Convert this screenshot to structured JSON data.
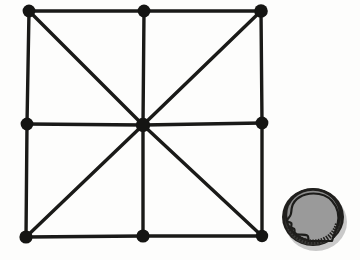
{
  "figure": {
    "background_color": "#fdfdfc",
    "ink_color": "#1a1a18",
    "canvas": {
      "width": 360,
      "height": 260
    }
  },
  "graph": {
    "style": {
      "edge_color": "#1a1a18",
      "edge_width": 3.4,
      "node_color": "#151513",
      "node_radius": 6.2,
      "center_node_radius": 7.0
    },
    "nodes": [
      {
        "id": "top-left",
        "label": "top-left corner node",
        "x": 29,
        "y": 11,
        "r": 6.4
      },
      {
        "id": "top-middle",
        "label": "top-middle node",
        "x": 144,
        "y": 11,
        "r": 6.4
      },
      {
        "id": "top-right",
        "label": "top-right corner node",
        "x": 261,
        "y": 11,
        "r": 6.8
      },
      {
        "id": "left-middle",
        "label": "left-middle node",
        "x": 27,
        "y": 124,
        "r": 6.4
      },
      {
        "id": "center",
        "label": "center hub node",
        "x": 143,
        "y": 125,
        "r": 7.2
      },
      {
        "id": "right-middle",
        "label": "right-middle node",
        "x": 262,
        "y": 123,
        "r": 6.4
      },
      {
        "id": "bottom-left",
        "label": "bottom-left corner node",
        "x": 26,
        "y": 237,
        "r": 6.6
      },
      {
        "id": "bottom-middle",
        "label": "bottom-middle node",
        "x": 143,
        "y": 236,
        "r": 6.6
      },
      {
        "id": "bottom-right",
        "label": "bottom-right corner node",
        "x": 262,
        "y": 236,
        "r": 6.2
      }
    ],
    "edges": [
      {
        "id": "top-left-segment",
        "from": "top-left",
        "to": "top-middle",
        "kind": "perimeter"
      },
      {
        "id": "top-right-segment",
        "from": "top-middle",
        "to": "top-right",
        "kind": "perimeter"
      },
      {
        "id": "right-upper-segment",
        "from": "top-right",
        "to": "right-middle",
        "kind": "perimeter"
      },
      {
        "id": "right-lower-segment",
        "from": "right-middle",
        "to": "bottom-right",
        "kind": "perimeter"
      },
      {
        "id": "bottom-right-segment",
        "from": "bottom-right",
        "to": "bottom-middle",
        "kind": "perimeter"
      },
      {
        "id": "bottom-left-segment",
        "from": "bottom-middle",
        "to": "bottom-left",
        "kind": "perimeter"
      },
      {
        "id": "left-lower-segment",
        "from": "bottom-left",
        "to": "left-middle",
        "kind": "perimeter"
      },
      {
        "id": "left-upper-segment",
        "from": "left-middle",
        "to": "top-left",
        "kind": "perimeter"
      },
      {
        "id": "spoke-up",
        "from": "center",
        "to": "top-middle",
        "kind": "spoke"
      },
      {
        "id": "spoke-down",
        "from": "center",
        "to": "bottom-middle",
        "kind": "spoke"
      },
      {
        "id": "spoke-left",
        "from": "center",
        "to": "left-middle",
        "kind": "spoke"
      },
      {
        "id": "spoke-right",
        "from": "center",
        "to": "right-middle",
        "kind": "spoke"
      },
      {
        "id": "spoke-diag-up-left",
        "from": "center",
        "to": "top-left",
        "kind": "diagonal"
      },
      {
        "id": "spoke-diag-up-right",
        "from": "center",
        "to": "top-right",
        "kind": "diagonal"
      },
      {
        "id": "spoke-diag-down-left",
        "from": "center",
        "to": "bottom-left",
        "kind": "diagonal"
      },
      {
        "id": "spoke-diag-down-right",
        "from": "center",
        "to": "bottom-right",
        "kind": "diagonal"
      }
    ]
  },
  "coin": {
    "label": "coin scale reference",
    "icon": "coin-profile-head-icon",
    "center_x": 313,
    "center_y": 218,
    "radius": 32,
    "rim_color": "#201f1d",
    "face_color": "#8d8d8d",
    "shadow_color": "#c9c9c9",
    "edge_band_color": "#3a3a38",
    "profile_color": "#9a9a9a",
    "profile_outline_color": "#1c1c1a"
  }
}
